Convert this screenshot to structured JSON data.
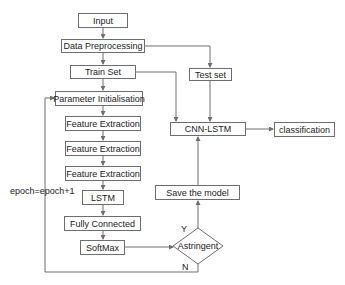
{
  "diagram": {
    "type": "flowchart",
    "nodes": {
      "input": "Input",
      "data_preprocessing": "Data Preprocessing",
      "train_set": "Train Set",
      "test_set": "Test set",
      "parameter_init": "Parameter Initialisation",
      "feature_extraction_1": "Feature Extraction",
      "feature_extraction_2": "Feature Extraction",
      "feature_extraction_3": "Feature Extraction",
      "lstm": "LSTM",
      "fully_connected": "Fully Connected",
      "softmax": "SoftMax",
      "astringent": "Astringent",
      "save_model": "Save the model",
      "cnn_lstm": "CNN-LSTM",
      "classification": "classification"
    },
    "labels": {
      "loop": "epoch=epoch+1",
      "yes": "Y",
      "no": "N"
    },
    "edges": [
      [
        "Input",
        "Data Preprocessing"
      ],
      [
        "Data Preprocessing",
        "Train Set"
      ],
      [
        "Data Preprocessing",
        "Test set"
      ],
      [
        "Train Set",
        "Parameter Initialisation"
      ],
      [
        "Train Set",
        "CNN-LSTM"
      ],
      [
        "Test set",
        "CNN-LSTM"
      ],
      [
        "Parameter Initialisation",
        "Feature Extraction"
      ],
      [
        "Feature Extraction",
        "Feature Extraction"
      ],
      [
        "Feature Extraction",
        "Feature Extraction"
      ],
      [
        "Feature Extraction",
        "LSTM"
      ],
      [
        "LSTM",
        "Fully Connected"
      ],
      [
        "Fully Connected",
        "SoftMax"
      ],
      [
        "SoftMax",
        "Astringent"
      ],
      [
        "Astringent",
        "Save the model",
        "Y"
      ],
      [
        "Astringent",
        "Parameter Initialisation",
        "N"
      ],
      [
        "Save the model",
        "CNN-LSTM"
      ],
      [
        "CNN-LSTM",
        "classification"
      ]
    ]
  }
}
